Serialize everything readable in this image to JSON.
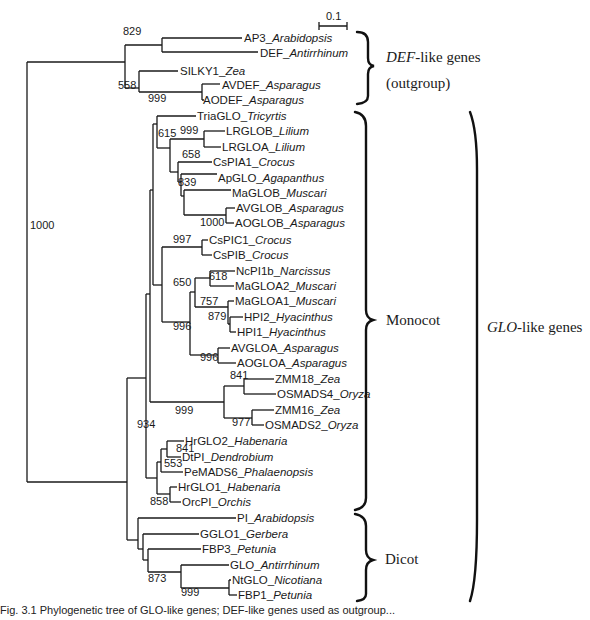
{
  "figure": {
    "scale_bar_label": "0.1",
    "caption_visible": "Fig. 3.1  Phylogenetic tree of GLO-like genes; DEF-like genes used as outgroup..."
  },
  "leaves": [
    {
      "id": "AP3",
      "gene": "AP3_",
      "species": "Arabidopsis",
      "x": 244,
      "y": 38
    },
    {
      "id": "DEF",
      "gene": "DEF_",
      "species": "Antirrhinum",
      "x": 260,
      "y": 53
    },
    {
      "id": "SILKY1",
      "gene": "SILKY1_",
      "species": "Zea",
      "x": 180,
      "y": 71
    },
    {
      "id": "AVDEF",
      "gene": "AVDEF_",
      "species": "Asparagus",
      "x": 222,
      "y": 85
    },
    {
      "id": "AODEF",
      "gene": "AODEF_",
      "species": "Asparagus",
      "x": 203,
      "y": 100
    },
    {
      "id": "TriaGLO",
      "gene": "TriaGLO_",
      "species": "Tricyrtis",
      "x": 197,
      "y": 116
    },
    {
      "id": "LRGLOB",
      "gene": "LRGLOB_",
      "species": "Lilium",
      "x": 226,
      "y": 131
    },
    {
      "id": "LRGLOA",
      "gene": "LRGLOA_",
      "species": "Lilium",
      "x": 222,
      "y": 147
    },
    {
      "id": "CsPIA1",
      "gene": "CsPIA1_",
      "species": "Crocus",
      "x": 213,
      "y": 162
    },
    {
      "id": "ApGLO",
      "gene": "ApGLO_",
      "species": "Agapanthus",
      "x": 218,
      "y": 178
    },
    {
      "id": "MaGLOB",
      "gene": "MaGLOB_",
      "species": "Muscari",
      "x": 232,
      "y": 193
    },
    {
      "id": "AVGLOB",
      "gene": "AVGLOB_",
      "species": "Asparagus",
      "x": 236,
      "y": 208
    },
    {
      "id": "AOGLOB",
      "gene": "AOGLOB_",
      "species": "Asparagus",
      "x": 235,
      "y": 223
    },
    {
      "id": "CsPIC1",
      "gene": "CsPIC1_",
      "species": "Crocus",
      "x": 209,
      "y": 240
    },
    {
      "id": "CsPIB",
      "gene": "CsPIB_",
      "species": "Crocus",
      "x": 213,
      "y": 255
    },
    {
      "id": "NcPI1b",
      "gene": "NcPI1b_",
      "species": "Narcissus",
      "x": 236,
      "y": 271
    },
    {
      "id": "MaGLOA2",
      "gene": "MaGLOA2_",
      "species": "Muscari",
      "x": 235,
      "y": 286
    },
    {
      "id": "MaGLOA1",
      "gene": "MaGLOA1_",
      "species": "Muscari",
      "x": 235,
      "y": 301
    },
    {
      "id": "HPI2",
      "gene": "HPI2_",
      "species": "Hyacinthus",
      "x": 244,
      "y": 317
    },
    {
      "id": "HPI1",
      "gene": "HPI1_",
      "species": "Hyacinthus",
      "x": 237,
      "y": 332
    },
    {
      "id": "AVGLOA",
      "gene": "AVGLOA_",
      "species": "Asparagus",
      "x": 231,
      "y": 348
    },
    {
      "id": "AOGLOA",
      "gene": "AOGLOA_",
      "species": "Asparagus",
      "x": 237,
      "y": 363
    },
    {
      "id": "ZMM18",
      "gene": "ZMM18_",
      "species": "Zea",
      "x": 275,
      "y": 379
    },
    {
      "id": "OSMADS4",
      "gene": "OSMADS4_",
      "species": "Oryza",
      "x": 277,
      "y": 394
    },
    {
      "id": "ZMM16",
      "gene": "ZMM16_",
      "species": "Zea",
      "x": 275,
      "y": 410
    },
    {
      "id": "OSMADS2",
      "gene": "OSMADS2_",
      "species": "Oryza",
      "x": 265,
      "y": 425
    },
    {
      "id": "HrGLO2",
      "gene": "HrGLO2_",
      "species": "Habenaria",
      "x": 185,
      "y": 441
    },
    {
      "id": "DtPI",
      "gene": "DtPI_",
      "species": "Dendrobium",
      "x": 182,
      "y": 457
    },
    {
      "id": "PeMADS6",
      "gene": "PeMADS6_",
      "species": "Phalaenopsis",
      "x": 184,
      "y": 472
    },
    {
      "id": "HrGLO1",
      "gene": "HrGLO1_",
      "species": "Habenaria",
      "x": 178,
      "y": 487
    },
    {
      "id": "OrcPI",
      "gene": "OrcPI_",
      "species": "Orchis",
      "x": 182,
      "y": 502
    },
    {
      "id": "PI",
      "gene": "PI_",
      "species": "Arabidopsis",
      "x": 237,
      "y": 518
    },
    {
      "id": "GGLO1",
      "gene": "GGLO1_",
      "species": "Gerbera",
      "x": 200,
      "y": 534
    },
    {
      "id": "FBP3",
      "gene": "FBP3_",
      "species": "Petunia",
      "x": 202,
      "y": 549
    },
    {
      "id": "GLO",
      "gene": "GLO_",
      "species": "Antirrhinum",
      "x": 230,
      "y": 565
    },
    {
      "id": "NtGLO",
      "gene": "NtGLO_",
      "species": "Nicotiana",
      "x": 232,
      "y": 580
    },
    {
      "id": "FBP1",
      "gene": "FBP1_",
      "species": "Petunia",
      "x": 238,
      "y": 595
    }
  ],
  "bootstrap": [
    {
      "value": "829",
      "x": 123,
      "y": 35
    },
    {
      "value": "558",
      "x": 118,
      "y": 89
    },
    {
      "value": "999",
      "x": 148,
      "y": 102
    },
    {
      "value": "1000",
      "x": 30,
      "y": 229
    },
    {
      "value": "615",
      "x": 158,
      "y": 137
    },
    {
      "value": "999",
      "x": 180,
      "y": 134
    },
    {
      "value": "658",
      "x": 182,
      "y": 158
    },
    {
      "value": "839",
      "x": 178,
      "y": 186
    },
    {
      "value": "1000",
      "x": 200,
      "y": 226
    },
    {
      "value": "997",
      "x": 173,
      "y": 243
    },
    {
      "value": "650",
      "x": 173,
      "y": 286
    },
    {
      "value": "618",
      "x": 209,
      "y": 280
    },
    {
      "value": "757",
      "x": 200,
      "y": 305
    },
    {
      "value": "879",
      "x": 208,
      "y": 320
    },
    {
      "value": "996",
      "x": 173,
      "y": 330
    },
    {
      "value": "996",
      "x": 200,
      "y": 361
    },
    {
      "value": "841",
      "x": 230,
      "y": 379
    },
    {
      "value": "999",
      "x": 175,
      "y": 414
    },
    {
      "value": "977",
      "x": 232,
      "y": 426
    },
    {
      "value": "934",
      "x": 137,
      "y": 428
    },
    {
      "value": "841",
      "x": 176,
      "y": 452
    },
    {
      "value": "553",
      "x": 164,
      "y": 467
    },
    {
      "value": "858",
      "x": 150,
      "y": 505
    },
    {
      "value": "873",
      "x": 148,
      "y": 582
    },
    {
      "value": "999",
      "x": 181,
      "y": 596
    }
  ],
  "groups": [
    {
      "id": "def",
      "label_italic": "DEF",
      "label_rest": "-like genes",
      "line2": "(outgroup)",
      "x": 386,
      "y": 58,
      "y2": 83
    },
    {
      "id": "monocot",
      "label": "Monocot",
      "x": 390,
      "y": 322
    },
    {
      "id": "glo",
      "label_italic": "GLO",
      "label_rest": "-like genes",
      "x": 486,
      "y": 330
    },
    {
      "id": "dicot",
      "label": "Dicot",
      "x": 389,
      "y": 561
    }
  ],
  "chart_data": {
    "type": "phylogenetic_tree",
    "title": "",
    "scale_bar": 0.1,
    "newick_approx": "(((AP3_Arabidopsis,DEF_Antirrhinum)829,(SILKY1_Zea,(AVDEF_Asparagus,AODEF_Asparagus)999)558),(((TriaGLO_Tricyrtis,((LRGLOB_Lilium,LRGLOA_Lilium)999,(CsPIA1_Crocus,(ApGLO_Agapanthus,(MaGLOB_Muscari,(AVGLOB_Asparagus,AOGLOB_Asparagus)1000))839)658))615,((CsPIC1_Crocus,CsPIB_Crocus)997,(((NcPI1b_Narcissus,MaGLOA2_Muscari)618,(MaGLOA1_Muscari,(HPI2_Hyacinthus,HPI1_Hyacinthus)879)757),(AVGLOA_Asparagus,AOGLOA_Asparagus)996)650)996,((ZMM18_Zea,OSMADS4_Oryza)841,(ZMM16_Zea,OSMADS2_Oryza)977)999,((HrGLO2_Habenaria,DtPI_Dendrobium)841,PeMADS6_Phalaenopsis)553,(HrGLO1_Habenaria,OrcPI_Orchis)858)934,(PI_Arabidopsis,GGLO1_Gerbera,FBP3_Petunia,(GLO_Antirrhinum,(NtGLO_Nicotiana,FBP1_Petunia)999)873)))1000",
    "groups": [
      {
        "name": "DEF-like genes (outgroup)",
        "members": [
          "AP3",
          "DEF",
          "SILKY1",
          "AVDEF",
          "AODEF"
        ]
      },
      {
        "name": "Monocot",
        "members": [
          "TriaGLO",
          "LRGLOB",
          "LRGLOA",
          "CsPIA1",
          "ApGLO",
          "MaGLOB",
          "AVGLOB",
          "AOGLOB",
          "CsPIC1",
          "CsPIB",
          "NcPI1b",
          "MaGLOA2",
          "MaGLOA1",
          "HPI2",
          "HPI1",
          "AVGLOA",
          "AOGLOA",
          "ZMM18",
          "OSMADS4",
          "ZMM16",
          "OSMADS2",
          "HrGLO2",
          "DtPI",
          "PeMADS6",
          "HrGLO1",
          "OrcPI"
        ]
      },
      {
        "name": "Dicot",
        "members": [
          "PI",
          "GGLO1",
          "FBP3",
          "GLO",
          "NtGLO",
          "FBP1"
        ]
      },
      {
        "name": "GLO-like genes",
        "members": [
          "Monocot",
          "Dicot"
        ]
      }
    ]
  }
}
